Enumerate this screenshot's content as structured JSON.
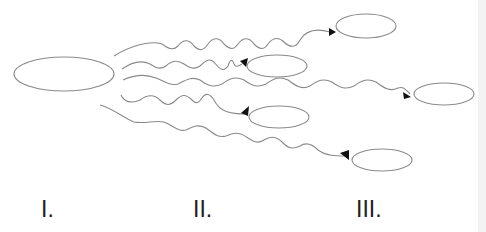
{
  "diagram": {
    "type": "branching-wavy-arrows",
    "stroke_color": "#8a8a8a",
    "arrowhead_color": "#111111",
    "source_node": {
      "id": "I",
      "cx": 64,
      "cy": 74,
      "rx": 50,
      "ry": 17
    },
    "target_nodes": [
      {
        "id": "t1",
        "stage": "III",
        "cx": 366,
        "cy": 26,
        "rx": 30,
        "ry": 12
      },
      {
        "id": "t2",
        "stage": "II",
        "cx": 277,
        "cy": 66,
        "rx": 30,
        "ry": 11
      },
      {
        "id": "t3",
        "stage": "III",
        "cx": 444,
        "cy": 94,
        "rx": 30,
        "ry": 11
      },
      {
        "id": "t4",
        "stage": "II",
        "cx": 279,
        "cy": 117,
        "rx": 30,
        "ry": 11
      },
      {
        "id": "t5",
        "stage": "III",
        "cx": 382,
        "cy": 160,
        "rx": 30,
        "ry": 11
      }
    ],
    "arrows": [
      {
        "from": "I",
        "to": "t1"
      },
      {
        "from": "I",
        "to": "t2"
      },
      {
        "from": "I",
        "to": "t3"
      },
      {
        "from": "I",
        "to": "t4"
      },
      {
        "from": "I",
        "to": "t5"
      }
    ]
  },
  "labels": {
    "stage_1": "I.",
    "stage_2": "II.",
    "stage_3": "III."
  }
}
